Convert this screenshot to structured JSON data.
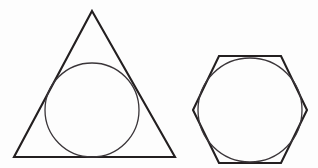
{
  "figure": {
    "background_color": "#fdfdfd",
    "stroke_color": "#231f20",
    "circle_stroke_color": "#3a3539",
    "canvas": {
      "width": 318,
      "height": 168
    },
    "shapes": [
      {
        "name": "equilateral-triangle",
        "kind": "polygon",
        "sides": 3,
        "label": "Equilateral triangle",
        "stroke_width": 2.1,
        "points": "92,11 175,157 14,157",
        "vertices": [
          {
            "x": 92,
            "y": 11,
            "role": "apex"
          },
          {
            "x": 175,
            "y": 157,
            "role": "bottom-right"
          },
          {
            "x": 14,
            "y": 157,
            "role": "bottom-left"
          }
        ],
        "inscribed_circle": {
          "name": "triangle-incircle",
          "cx": 92,
          "cy": 110,
          "r": 47,
          "stroke_width": 1.3
        }
      },
      {
        "name": "regular-hexagon",
        "kind": "polygon",
        "sides": 6,
        "label": "Regular hexagon",
        "orientation": "flat-top",
        "stroke_width": 2.1,
        "points": "219,56 281,56 307,110 281,163 219,163 193,110",
        "vertices": [
          {
            "x": 219,
            "y": 56,
            "role": "top-left"
          },
          {
            "x": 281,
            "y": 56,
            "role": "top-right"
          },
          {
            "x": 307,
            "y": 110,
            "role": "right"
          },
          {
            "x": 281,
            "y": 163,
            "role": "bottom-right"
          },
          {
            "x": 219,
            "y": 163,
            "role": "bottom-left"
          },
          {
            "x": 193,
            "y": 110,
            "role": "left"
          }
        ],
        "inscribed_circle": {
          "name": "hexagon-incircle",
          "cx": 250,
          "cy": 110,
          "r": 52,
          "stroke_width": 1.3
        }
      }
    ]
  }
}
